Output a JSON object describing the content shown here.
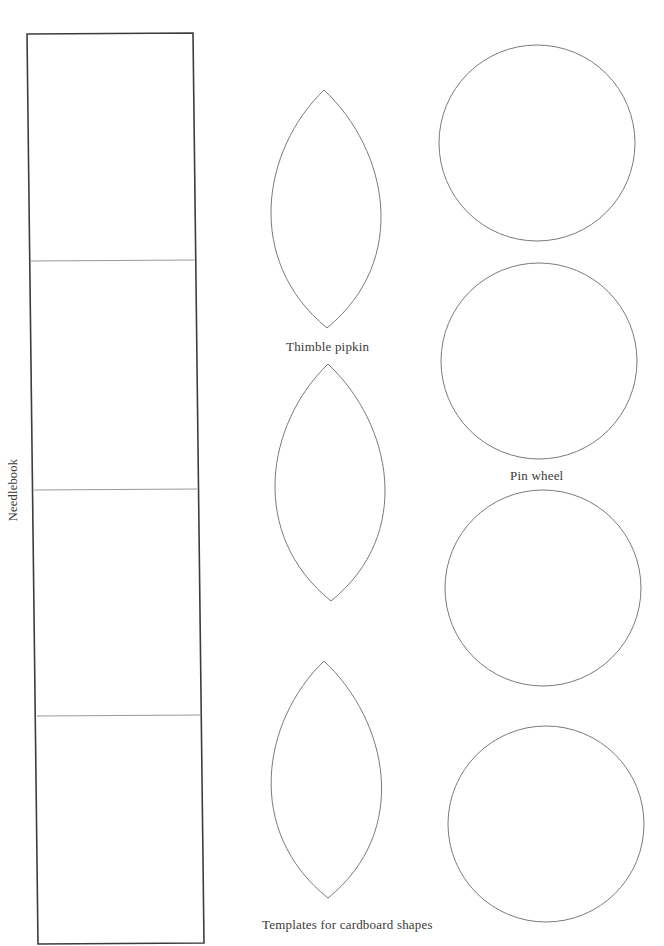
{
  "document": {
    "labels": {
      "needlebook": "Needlebook",
      "thimble_pipkin": "Thimble pipkin",
      "pin_wheel": "Pin wheel",
      "templates_caption": "Templates for cardboard shapes"
    },
    "shapes": {
      "needlebook_panel": {
        "type": "rectangle",
        "sections": 4,
        "stroke_color": "#3c3c3c"
      },
      "leaves": [
        {
          "id": "leaf-1",
          "type": "vesica",
          "group": "Thimble pipkin"
        },
        {
          "id": "leaf-2",
          "type": "vesica",
          "group": "Thimble pipkin"
        },
        {
          "id": "leaf-3",
          "type": "vesica",
          "group": "Thimble pipkin"
        }
      ],
      "circles": [
        {
          "id": "circle-1",
          "type": "circle",
          "group": "Pin wheel"
        },
        {
          "id": "circle-2",
          "type": "circle",
          "group": "Pin wheel"
        },
        {
          "id": "circle-3",
          "type": "circle",
          "group": "Pin wheel"
        },
        {
          "id": "circle-4",
          "type": "circle",
          "group": "Pin wheel"
        }
      ],
      "outline_color": "#7a7a7a"
    }
  }
}
